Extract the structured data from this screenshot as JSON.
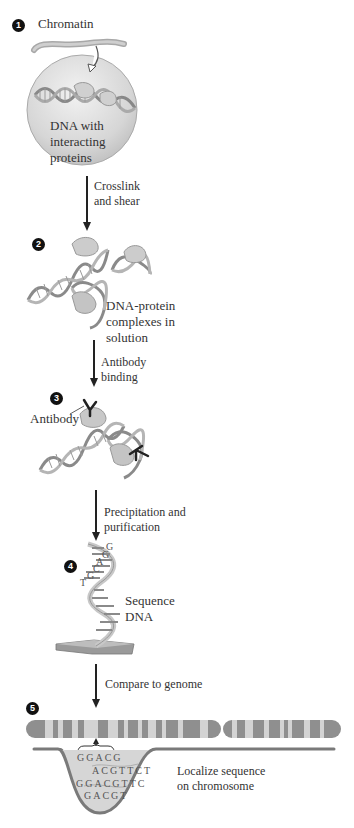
{
  "figure": {
    "colors": {
      "nucleus_fill": "#d8d8d8",
      "dna_strand": "#8a8a8a",
      "protein_fill": "#c8c8c8",
      "antibody": "#222222",
      "chromosome_dark": "#8f8f8f",
      "chromosome_light": "#d3d3d3",
      "trough_fill": "#d6d6d6",
      "trough_outline": "#7a7a7a",
      "step_badge": "#111111"
    }
  },
  "steps": [
    {
      "number": "1",
      "labels": {
        "chromatin": "Chromatin",
        "dna_line1": "DNA with",
        "dna_line2": "interacting",
        "dna_line3": "proteins"
      },
      "arrow_label": [
        "Crosslink",
        "and shear"
      ]
    },
    {
      "number": "2",
      "labels": {
        "line1": "DNA-protein",
        "line2": "complexes in",
        "line3": "solution"
      },
      "arrow_label": [
        "Antibody",
        "binding"
      ]
    },
    {
      "number": "3",
      "labels": {
        "antibody": "Antibody"
      },
      "arrow_label": [
        "Precipitation and",
        "purification"
      ]
    },
    {
      "number": "4",
      "bases": [
        "G",
        "G",
        "A",
        "C",
        "G",
        "T"
      ],
      "labels": {
        "line1": "Sequence",
        "line2": "DNA"
      },
      "arrow_label": [
        "Compare to genome"
      ]
    },
    {
      "number": "5",
      "reads": [
        "GGACG",
        "ACGTTCT",
        "GGACGTTC",
        "GACGT"
      ],
      "labels": {
        "line1": "Localize sequence",
        "line2": "on chromosome"
      }
    }
  ]
}
